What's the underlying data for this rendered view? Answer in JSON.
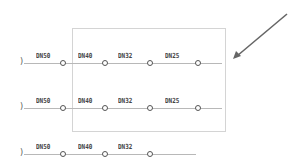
{
  "diagram": {
    "rows": [
      {
        "y": 63,
        "line_end": 222,
        "nodes": [
          63,
          105,
          150,
          198
        ],
        "labels": [
          {
            "text": "DN50",
            "x": 36
          },
          {
            "text": "DN40",
            "x": 78
          },
          {
            "text": "DN32",
            "x": 118
          },
          {
            "text": "DN25",
            "x": 165
          }
        ]
      },
      {
        "y": 108,
        "line_end": 222,
        "nodes": [
          63,
          105,
          150,
          198
        ],
        "labels": [
          {
            "text": "DN50",
            "x": 36
          },
          {
            "text": "DN40",
            "x": 78
          },
          {
            "text": "DN32",
            "x": 118
          },
          {
            "text": "DN25",
            "x": 165
          }
        ]
      },
      {
        "y": 154,
        "line_end": 196,
        "nodes": [
          63,
          105,
          150
        ],
        "labels": [
          {
            "text": "DN50",
            "x": 36
          },
          {
            "text": "DN40",
            "x": 78
          },
          {
            "text": "DN32",
            "x": 118
          }
        ]
      }
    ],
    "start_mark": ")",
    "frame": {
      "x": 72,
      "y": 28,
      "w": 154,
      "h": 104
    },
    "arrow": {
      "x1": 287,
      "y1": 14,
      "x2": 234,
      "y2": 58,
      "color": "#666666"
    }
  }
}
